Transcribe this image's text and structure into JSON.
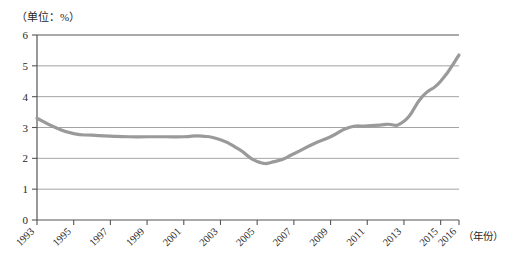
{
  "chart_data": {
    "type": "line",
    "title": "",
    "unit_note": "（单位：%）",
    "xlabel": "（年份）",
    "ylabel": "",
    "ylim": [
      0,
      6
    ],
    "ytick_values": [
      0,
      1,
      2,
      3,
      4,
      5,
      6
    ],
    "ytick_labels": [
      "0",
      "1",
      "2",
      "3",
      "4",
      "5",
      "6"
    ],
    "grid": true,
    "grid_axis": "y",
    "legend": "none",
    "xlim": [
      1993,
      2016
    ],
    "x": [
      1993,
      1994,
      1995,
      1996,
      1997,
      1998,
      1999,
      2000,
      2001,
      2002,
      2003,
      2004,
      2005,
      2006,
      2007,
      2008,
      2009,
      2010,
      2011,
      2012,
      2013,
      2014,
      2015,
      2016
    ],
    "xtick_values": [
      1993,
      1995,
      1997,
      1999,
      2001,
      2003,
      2005,
      2007,
      2009,
      2011,
      2013,
      2015,
      2016
    ],
    "xtick_labels": [
      "1993",
      "1995",
      "1997",
      "1999",
      "2001",
      "2003",
      "2005",
      "2007",
      "2009",
      "2011",
      "2013",
      "2015",
      "2016"
    ],
    "series": [
      {
        "name": "",
        "color": "#9a9a9a",
        "line_width": 3.2,
        "values": [
          3.3,
          3.0,
          2.8,
          2.75,
          2.72,
          2.7,
          2.7,
          2.7,
          2.7,
          2.72,
          2.6,
          2.3,
          1.9,
          1.9,
          2.15,
          2.45,
          2.7,
          3.0,
          3.05,
          3.1,
          3.2,
          4.0,
          4.5,
          5.35
        ]
      }
    ]
  },
  "colors": {
    "line": "#9a9a9a",
    "axis": "#555555",
    "grid": "#8c8c8c",
    "text": "#1f1f1f",
    "background": "#ffffff"
  }
}
